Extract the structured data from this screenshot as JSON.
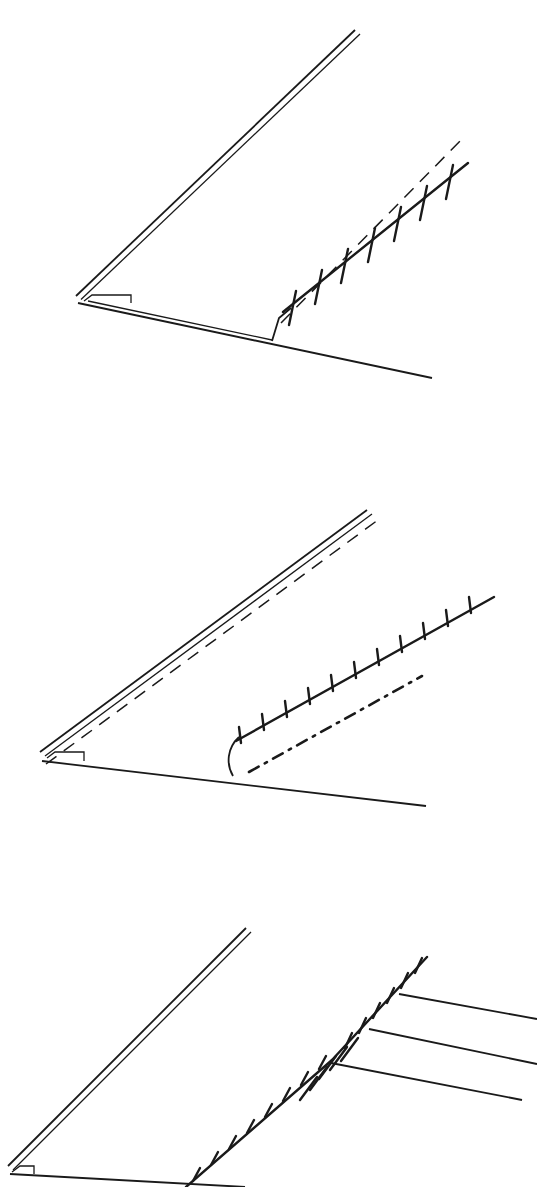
{
  "document": {
    "kind": "line-drawing-figure",
    "title": "Three-panel schematic line drawing",
    "panel_count": 3,
    "background_color": "#ffffff",
    "ink_color": "#1a1a1a",
    "width_px": 537,
    "height_px": 1187
  },
  "chart_data": {
    "type": "line",
    "xlabel": "",
    "ylabel": "",
    "grid": false,
    "legend": "none",
    "xlim": [
      0,
      537
    ],
    "panels": [
      {
        "id": "a",
        "label": "panel-a",
        "origin_y": 0,
        "height": 420,
        "apex": [
          76,
          297
        ],
        "elements": [
          {
            "name": "upper-limb-double-line",
            "style": "solid",
            "stroke_width": 1.6,
            "points": [
              [
                76,
                296
              ],
              [
                355,
                30
              ]
            ],
            "offset_points": [
              [
                80,
                299
              ],
              [
                360,
                34
              ]
            ]
          },
          {
            "name": "apex-fold-hook",
            "style": "solid",
            "stroke_width": 1.6,
            "points": [
              [
                83,
                300
              ],
              [
                90,
                295
              ],
              [
                128,
                295
              ],
              [
                128,
                302
              ]
            ]
          },
          {
            "name": "lower-limb-double-line",
            "style": "solid",
            "stroke_width": 1.6,
            "points": [
              [
                78,
                303
              ],
              [
                430,
                378
              ]
            ],
            "offset_points": [
              [
                84,
                300
              ],
              [
                272,
                340
              ]
            ]
          },
          {
            "name": "riser-connector",
            "style": "solid",
            "stroke_width": 1.6,
            "points": [
              [
                272,
                340
              ],
              [
                278,
                318
              ],
              [
                290,
                307
              ]
            ]
          },
          {
            "name": "barbed-boundary-line",
            "style": "solid",
            "stroke_width": 2.4,
            "points": [
              [
                283,
                310
              ],
              [
                466,
                163
              ]
            ],
            "barb_count": 7,
            "barb_length": 30,
            "barb_orientation": "vertical"
          },
          {
            "name": "dashed-trace-line",
            "style": "dashed",
            "stroke_width": 1.6,
            "points": [
              [
                280,
                322
              ],
              [
                462,
                139
              ]
            ]
          }
        ]
      },
      {
        "id": "b",
        "label": "panel-b",
        "origin_y": 460,
        "height": 400,
        "apex": [
          40,
          292
        ],
        "elements": [
          {
            "name": "upper-limb-double-line",
            "style": "solid",
            "stroke_width": 1.6,
            "points": [
              [
                40,
                292
              ],
              [
                367,
                50
              ]
            ],
            "offset_points": [
              [
                45,
                296
              ],
              [
                372,
                54
              ]
            ]
          },
          {
            "name": "apex-fold-hook",
            "style": "solid",
            "stroke_width": 1.6,
            "points": [
              [
                47,
                297
              ],
              [
                54,
                292
              ],
              [
                82,
                292
              ],
              [
                82,
                300
              ]
            ]
          },
          {
            "name": "upper-dashed-trace",
            "style": "dashed",
            "stroke_width": 1.5,
            "points": [
              [
                45,
                302
              ],
              [
                380,
                56
              ]
            ]
          },
          {
            "name": "lower-limb-line",
            "style": "solid",
            "stroke_width": 1.6,
            "points": [
              [
                42,
                300
              ],
              [
                424,
                345
              ]
            ]
          },
          {
            "name": "curved-riser-connector",
            "style": "solid",
            "stroke_width": 1.8,
            "points": [
              [
                232,
                315
              ],
              [
                228,
                300
              ],
              [
                230,
                285
              ],
              [
                238,
                277
              ]
            ]
          },
          {
            "name": "barbed-boundary-line",
            "style": "solid",
            "stroke_width": 2.2,
            "points": [
              [
                235,
                280
              ],
              [
                492,
                137
              ]
            ],
            "barb_count": 11,
            "barb_length": 16,
            "barb_orientation": "vertical-up"
          },
          {
            "name": "dash-dot-trace-line",
            "style": "dash-dot",
            "stroke_width": 2.6,
            "points": [
              [
                248,
                311
              ],
              [
                420,
                216
              ]
            ]
          }
        ]
      },
      {
        "id": "c",
        "label": "panel-c",
        "origin_y": 900,
        "height": 287,
        "apex": [
          8,
          266
        ],
        "elements": [
          {
            "name": "upper-limb-double-line",
            "style": "solid",
            "stroke_width": 1.6,
            "points": [
              [
                8,
                266
              ],
              [
                246,
                28
              ]
            ],
            "offset_points": [
              [
                13,
                270
              ],
              [
                251,
                32
              ]
            ]
          },
          {
            "name": "apex-fold-hook",
            "style": "solid",
            "stroke_width": 1.6,
            "points": [
              [
                12,
                271
              ],
              [
                19,
                266
              ],
              [
                33,
                266
              ],
              [
                33,
                273
              ]
            ]
          },
          {
            "name": "lower-limb-line",
            "style": "solid",
            "stroke_width": 1.6,
            "points": [
              [
                14,
                272
              ],
              [
                240,
                287
              ]
            ]
          },
          {
            "name": "barbed-boundary-lower",
            "style": "solid",
            "stroke_width": 2.2,
            "points": [
              [
                190,
                287
              ],
              [
                330,
                160
              ]
            ],
            "barb_count": 9,
            "barb_length": 14,
            "barb_orientation": "perpendicular-up"
          },
          {
            "name": "barbed-boundary-upper",
            "style": "solid",
            "stroke_width": 2.2,
            "points": [
              [
                330,
                160
              ],
              [
                425,
                58
              ]
            ],
            "barb_count": 7,
            "barb_length": 16,
            "barb_orientation": "perpendicular-up"
          },
          {
            "name": "cross-hatch-cluster",
            "style": "solid",
            "stroke_width": 2.2,
            "tick_count": 8,
            "tick_length": 26,
            "along": [
              [
                330,
                160
              ],
              [
                385,
                101
              ]
            ]
          },
          {
            "name": "branch-line-1",
            "style": "solid",
            "stroke_width": 1.6,
            "points": [
              [
                398,
                95
              ],
              [
                537,
                120
              ]
            ]
          },
          {
            "name": "branch-line-2",
            "style": "solid",
            "stroke_width": 1.6,
            "points": [
              [
                368,
                130
              ],
              [
                537,
                165
              ]
            ]
          },
          {
            "name": "branch-line-3",
            "style": "solid",
            "stroke_width": 1.6,
            "points": [
              [
                330,
                163
              ],
              [
                520,
                200
              ]
            ]
          }
        ]
      }
    ]
  }
}
